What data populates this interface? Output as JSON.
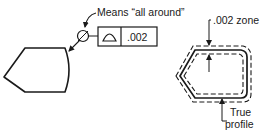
{
  "figure": {
    "left": {
      "callout_label": "Means “all around”",
      "frame": {
        "symbol": "profile-of-a-surface-icon",
        "tolerance": ".002"
      },
      "all_around_symbol": "all-around-circle-icon"
    },
    "right": {
      "zone_label": ".002 zone",
      "profile_label_line1": "True",
      "profile_label_line2": "profile"
    }
  },
  "colors": {
    "ink": "#1a1a1a",
    "background": "#ffffff"
  }
}
